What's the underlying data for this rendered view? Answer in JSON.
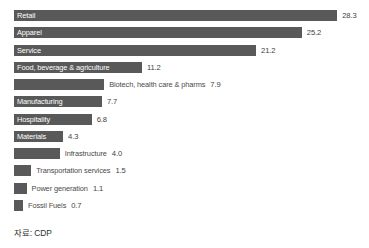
{
  "chart_data": {
    "type": "bar",
    "orientation": "horizontal",
    "title": "",
    "subtitle": "",
    "xlabel": "",
    "ylabel": "",
    "grid": false,
    "legend": "none",
    "xlim": [
      0,
      28.3
    ],
    "categories": [
      "Retail",
      "Apparel",
      "Service",
      "Food, beverage & agriculture",
      "Biotech, health care & pharms",
      "Manufacturing",
      "Hospitality",
      "Materials",
      "Infrastructure",
      "Transportation services",
      "Power generation",
      "Fossil Fuels"
    ],
    "values": [
      28.3,
      25.2,
      21.2,
      11.2,
      7.9,
      7.7,
      6.8,
      4.3,
      4.0,
      1.5,
      1.1,
      0.7
    ],
    "value_labels": [
      "28.3",
      "25.2",
      "21.2",
      "11.2",
      "7.9",
      "7.7",
      "6.8",
      "4.3",
      "4.0",
      "1.5",
      "1.1",
      "0.7"
    ],
    "bars": [
      {
        "category": "Retail",
        "value": 28.3,
        "value_label": "28.3",
        "label_position": "inside"
      },
      {
        "category": "Apparel",
        "value": 25.2,
        "value_label": "25.2",
        "label_position": "inside"
      },
      {
        "category": "Service",
        "value": 21.2,
        "value_label": "21.2",
        "label_position": "inside"
      },
      {
        "category": "Food, beverage & agriculture",
        "value": 11.2,
        "value_label": "11.2",
        "label_position": "inside"
      },
      {
        "category": "Biotech, health care & pharms",
        "value": 7.9,
        "value_label": "7.9",
        "label_position": "outside"
      },
      {
        "category": "Manufacturing",
        "value": 7.7,
        "value_label": "7.7",
        "label_position": "inside"
      },
      {
        "category": "Hospitality",
        "value": 6.8,
        "value_label": "6.8",
        "label_position": "inside"
      },
      {
        "category": "Materials",
        "value": 4.3,
        "value_label": "4.3",
        "label_position": "inside"
      },
      {
        "category": "Infrastructure",
        "value": 4.0,
        "value_label": "4.0",
        "label_position": "outside"
      },
      {
        "category": "Transportation services",
        "value": 1.5,
        "value_label": "1.5",
        "label_position": "outside"
      },
      {
        "category": "Power generation",
        "value": 1.1,
        "value_label": "1.1",
        "label_position": "outside"
      },
      {
        "category": "Fossil Fuels",
        "value": 0.7,
        "value_label": "0.7",
        "label_position": "outside"
      }
    ],
    "colors": {
      "bar": "#595959",
      "background": "#ffffff",
      "label_inside": "#ffffff",
      "label_outside": "#4a4a4a",
      "value_text": "#3f3f3f",
      "source_text": "#2e2e2e"
    }
  },
  "footer": {
    "source": "자료: CDP"
  }
}
